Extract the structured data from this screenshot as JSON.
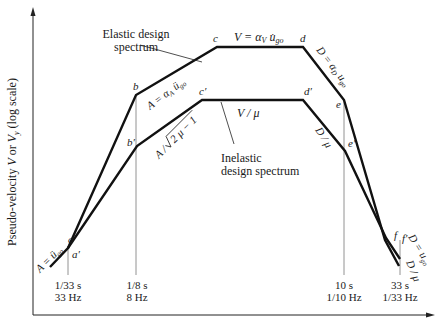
{
  "axes": {
    "y_label": "Pseudo-velocity V or Vy (log scale)",
    "y_label_main": "Pseudo-velocity ",
    "y_label_v": "V",
    "y_label_or": " or ",
    "y_label_vy": "V",
    "y_label_sub": "y",
    "y_label_tail": " (log scale)"
  },
  "points": {
    "a": "a",
    "a_prime": "a′",
    "b": "b",
    "b_prime": "b′",
    "c": "c",
    "c_prime": "c′",
    "d": "d",
    "d_prime": "d′",
    "e": "e",
    "e_prime": "e′",
    "f": "f",
    "f_prime": "f′"
  },
  "segment_labels": {
    "a_ground": "A = ü",
    "a_ground_sub": "go",
    "b_c_elastic": "A = α",
    "b_c_elastic_sub": "A",
    "b_c_elastic_tail": " ü",
    "b_c_elastic_tail_sub": "go",
    "c_d_elastic": "V = α",
    "c_d_elastic_sub": "V",
    "c_d_elastic_tail": " u̇",
    "c_d_elastic_tail_sub": "go",
    "d_e_elastic": "D = α",
    "d_e_elastic_sub": "D",
    "d_e_elastic_tail": " u",
    "d_e_elastic_tail_sub": "go",
    "f_ground": "D = u",
    "f_ground_sub": "go",
    "b_c_inelastic": "A / √(2μ − 1)",
    "b_c_inelastic_pre": "A / ",
    "b_c_inelastic_rad": "2 μ − 1",
    "c_d_inelastic": "V / μ",
    "d_e_inelastic": "D / μ",
    "f_inelastic": "D / μ"
  },
  "callouts": {
    "elastic_line1": "Elastic design",
    "elastic_line2": "spectrum",
    "inelastic_line1": "Inelastic",
    "inelastic_line2": "design spectrum"
  },
  "period_markers": [
    {
      "period": "1/33 s",
      "freq": "33 Hz"
    },
    {
      "period": "1/8 s",
      "freq": "8 Hz"
    },
    {
      "period": "10 s",
      "freq": "1/10 Hz"
    },
    {
      "period": "33 s",
      "freq": "1/33 Hz"
    }
  ],
  "colors": {
    "curve": "#111111",
    "guide": "#777777",
    "text": "#1a1a1a"
  }
}
